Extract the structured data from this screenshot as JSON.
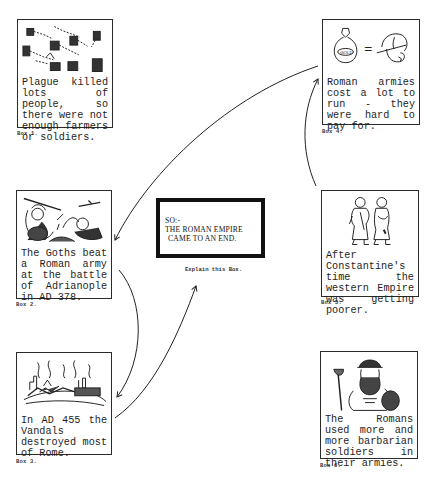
{
  "diagram": {
    "center": {
      "line1": "SO:-",
      "line2": "THE ROMAN EMPIRE",
      "line3": "CAME TO AN END.",
      "note": "Explain this Box."
    },
    "boxes": [
      {
        "id": 1,
        "label": "Box 1.",
        "caption": "Plague killed lots of people, so there were not enough farmers or soldiers.",
        "illustration": "plague-gravestones"
      },
      {
        "id": 2,
        "label": "Box 2.",
        "caption": "The Goths beat a Roman army at the battle of Adrianople in AD 378.",
        "illustration": "goth-warrior-fighting-roman"
      },
      {
        "id": 3,
        "label": "Box 3.",
        "caption": "In AD 455 the Vandals destroyed most of Rome.",
        "illustration": "burning-city"
      },
      {
        "id": 4,
        "label": "Box 4.",
        "caption": "Roman armies cost a lot to run - they were hard to pay for.",
        "illustration": "gold-bag-equals-helmet",
        "bag_text": "GOLD",
        "equals": "="
      },
      {
        "id": 5,
        "label": "Box 5.",
        "caption": "After Constantine's time the western Empire was getting poorer.",
        "illustration": "two-ragged-romans"
      },
      {
        "id": 6,
        "label": "Box 6.",
        "caption": "The Romans used more and more barbarian soldiers in their armies.",
        "illustration": "barbarian-soldier"
      }
    ],
    "arrows": [
      {
        "from": "box-4",
        "to": "box-2"
      },
      {
        "from": "box-5",
        "to": "box-4"
      },
      {
        "from": "box-2",
        "to": "box-3"
      },
      {
        "from": "box-3",
        "to": "center"
      }
    ]
  }
}
